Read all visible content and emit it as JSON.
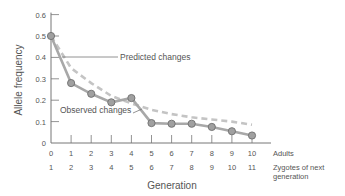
{
  "chart_data": {
    "type": "line",
    "title": "",
    "xlabel": "Generation",
    "ylabel": "Allele frequency",
    "ylim": [
      0,
      0.6
    ],
    "yticks": [
      "0",
      "0.1",
      "0.2",
      "0.3",
      "0.4",
      "0.5",
      "0.6"
    ],
    "x_rows": [
      {
        "name": "Adults",
        "labels": [
          "0",
          "1",
          "2",
          "3",
          "4",
          "5",
          "6",
          "7",
          "8",
          "9",
          "10"
        ]
      },
      {
        "name": "Zygotes of next generation",
        "labels": [
          "1",
          "2",
          "3",
          "4",
          "5",
          "6",
          "7",
          "8",
          "9",
          "10",
          "11"
        ]
      }
    ],
    "x": [
      0,
      1,
      2,
      3,
      4,
      5,
      6,
      7,
      8,
      9,
      10
    ],
    "series": [
      {
        "name": "Observed changes",
        "style": "solid-with-markers",
        "color": "#a8a8a8",
        "values": [
          0.5,
          0.28,
          0.23,
          0.19,
          0.21,
          0.093,
          0.09,
          0.09,
          0.075,
          0.055,
          0.035
        ]
      },
      {
        "name": "Predicted changes",
        "style": "dashed",
        "color": "#c4c4c4",
        "values": [
          0.5,
          0.35,
          0.28,
          0.22,
          0.185,
          0.155,
          0.135,
          0.12,
          0.11,
          0.1,
          0.085
        ]
      }
    ],
    "annotations": [
      "Predicted changes",
      "Observed changes"
    ],
    "grid": false,
    "legend": "inline annotations"
  },
  "labels": {
    "ylabel": "Allele frequency",
    "xlabel": "Generation",
    "row1": "Adults",
    "row2a": "Zygotes of next",
    "row2b": "generation",
    "predicted": "Predicted changes",
    "observed": "Observed changes"
  }
}
